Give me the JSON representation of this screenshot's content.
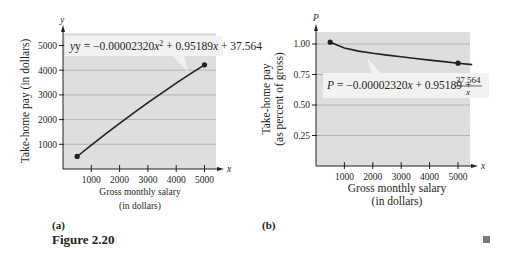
{
  "figure": {
    "caption": "Figure 2.20",
    "end_marker_color": "#7a7a7a",
    "plot_bg_color": "#dedede",
    "grid_color": "#a8a8a8",
    "label_box_color": "#f2f2f2"
  },
  "chart_data": [
    {
      "panel_label": "(a)",
      "type": "line",
      "title": "",
      "xlabel_line1": "Gross monthly salary",
      "xlabel_line2": "(in dollars)",
      "ylabel": "Take-home pay (in dollars)",
      "x_axis_var": "x",
      "y_axis_var": "y",
      "xlim": [
        0,
        5500
      ],
      "ylim": [
        0,
        5800
      ],
      "x_ticks": [
        1000,
        2000,
        3000,
        4000,
        5000
      ],
      "x_tick_labels": [
        "1000",
        "2000",
        "3000",
        "4000",
        "5000"
      ],
      "y_ticks": [
        1000,
        2000,
        3000,
        4000,
        5000
      ],
      "y_tick_labels": [
        "1000",
        "2000",
        "3000",
        "4000",
        "5000"
      ],
      "grid": "horizontal",
      "annotation": {
        "lhs": "y = −0.00002320",
        "var1": "x",
        "exp": "2",
        "mid": " + 0.95189",
        "var2": "x",
        "rhs": " + 37.564"
      },
      "series": [
        {
          "name": "y = -0.00002320x^2 + 0.95189x + 37.564",
          "x": [
            500,
            1000,
            1500,
            2000,
            2500,
            3000,
            3500,
            4000,
            4500,
            5000
          ],
          "values": [
            508,
            966,
            1413,
            1848,
            2272,
            2684,
            3084,
            3473,
            3851,
            4217
          ],
          "endpoints_marked": true
        }
      ]
    },
    {
      "panel_label": "(b)",
      "type": "line",
      "title": "",
      "xlabel_line1": "Gross monthly salary",
      "xlabel_line2": "(in dollars)",
      "ylabel_line1": "Take-home pay",
      "ylabel_line2": "(as percent of gross)",
      "x_axis_var": "x",
      "y_axis_var": "P",
      "xlim": [
        0,
        5500
      ],
      "ylim": [
        0,
        1.1
      ],
      "x_ticks": [
        1000,
        2000,
        3000,
        4000,
        5000
      ],
      "x_tick_labels": [
        "1000",
        "2000",
        "3000",
        "4000",
        "5000"
      ],
      "y_ticks": [
        0.25,
        0.5,
        0.75,
        1.0
      ],
      "y_tick_labels": [
        "0.25",
        "0.50",
        "0.75",
        "1.00"
      ],
      "grid": "horizontal",
      "annotation": {
        "lhs": "P",
        "eq": " = −0.00002320",
        "var1": "x",
        "mid": " + 0.95189 + ",
        "frac_num": "37.564",
        "frac_den": "x"
      },
      "series": [
        {
          "name": "P = -0.00002320x + 0.95189 + 37.564/x",
          "x": [
            500,
            1000,
            1500,
            2000,
            2500,
            3000,
            3500,
            4000,
            4500,
            5000,
            5500
          ],
          "values": [
            1.015,
            0.966,
            0.942,
            0.924,
            0.909,
            0.895,
            0.881,
            0.868,
            0.856,
            0.843,
            0.831
          ],
          "marked_points_x": [
            500,
            5000
          ]
        }
      ]
    }
  ]
}
